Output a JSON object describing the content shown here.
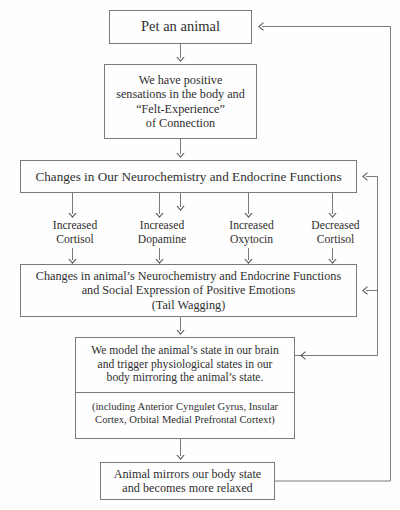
{
  "diagram": {
    "line_color": "#7a7a7a",
    "text_color": "#2f2f2f",
    "background": "#fefefe"
  },
  "boxes": {
    "pet_animal": {
      "lines": [
        "Pet an animal"
      ]
    },
    "positive_sensations": {
      "lines": [
        "We have positive",
        "sensations in the body and",
        "“Felt-Experience”",
        "of Connection"
      ]
    },
    "our_neurochemistry": {
      "lines": [
        "Changes in Our Neurochemistry and Endocrine Functions"
      ]
    },
    "animal_neurochemistry": {
      "lines": [
        "Changes in animal’s Neurochemistry and Endocrine Functions",
        "and Social Expression of Positive Emotions",
        "(Tail Wagging)"
      ]
    },
    "model_state": {
      "top_lines": [
        "We model the animal’s state in our brain",
        "and trigger physiological states in our",
        "body mirroring the animal’s state."
      ],
      "bottom_lines": [
        "(including Anterior Cyngulet Gyrus, Insular",
        "Cortex, Orbital Medial Prefrontal Cortext)"
      ]
    },
    "animal_relaxed": {
      "lines": [
        "Animal mirrors our body state",
        "and becomes more relaxed"
      ]
    }
  },
  "branches": [
    {
      "lines": [
        "Increased",
        "Cortisol"
      ]
    },
    {
      "lines": [
        "Increased",
        "Dopamine"
      ]
    },
    {
      "lines": [
        "Increased",
        "Oxytocin"
      ]
    },
    {
      "lines": [
        "Decreased",
        "Cortisol"
      ]
    }
  ]
}
